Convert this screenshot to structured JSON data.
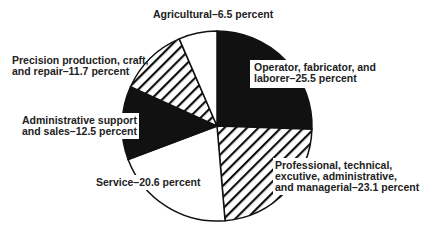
{
  "chart_data": {
    "type": "pie",
    "title": "",
    "start_angle_deg": 0,
    "direction": "clockwise",
    "slices": [
      {
        "label": "Operator, fabricator, and laborer",
        "value": 25.5,
        "fill": "solid",
        "color": "#111111"
      },
      {
        "label": "Professional, technical, excutive, administrative, and managerial",
        "value": 23.1,
        "fill": "hatch",
        "color": "#111111"
      },
      {
        "label": "Service",
        "value": 20.6,
        "fill": "white",
        "color": "#ffffff"
      },
      {
        "label": "Administrative support and sales",
        "value": 12.5,
        "fill": "solid",
        "color": "#111111"
      },
      {
        "label": "Precision production, craft, and repair",
        "value": 11.7,
        "fill": "hatch",
        "color": "#111111"
      },
      {
        "label": "Agricultural",
        "value": 6.5,
        "fill": "white",
        "color": "#ffffff"
      }
    ],
    "units": "percent"
  },
  "labels": {
    "operator": "Operator, fabricator, and\nlaborer–25.5 percent",
    "professional": "Professional, technical,\nexcutive, administrative,\nand managerial–23.1 percent",
    "service": "Service–20.6 percent",
    "admin": "Administrative support\nand sales–12.5 percent",
    "precision": "Precision production, craft,\nand repair–11.7 percent",
    "agricultural": "Agricultural–6.5 percent"
  }
}
